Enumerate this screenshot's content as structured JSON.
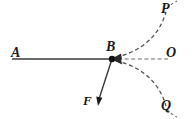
{
  "figure": {
    "background_color": "#ffffff",
    "stroke_color": "#3a3a3a",
    "label_color": "#1a1a1a",
    "labels": {
      "a": "A",
      "b": "B",
      "f": "F",
      "o": "O",
      "p": "P",
      "q": "Q"
    },
    "elements": {
      "beam_label": "beam-AB",
      "force_label": "force-vector-F",
      "axis_label": "dashed-axis-BO",
      "curve_upper_label": "dashed-curve-BP",
      "curve_lower_label": "dashed-curve-BQ",
      "vertex_label": "vertex-point-B"
    }
  }
}
